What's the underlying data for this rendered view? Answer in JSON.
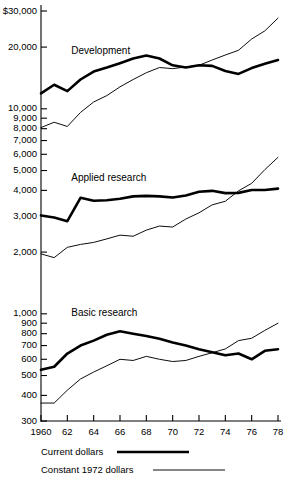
{
  "chart_data": {
    "type": "line",
    "title": "",
    "xlabel": "",
    "ylabel": "",
    "scale": "log",
    "grid": false,
    "legend_position": "bottom-left",
    "x": [
      1960,
      1961,
      1962,
      1963,
      1964,
      1965,
      1966,
      1967,
      1968,
      1969,
      1970,
      1971,
      1972,
      1973,
      1974,
      1975,
      1976,
      1977,
      1978
    ],
    "xtick_labels": [
      "1960",
      "62",
      "64",
      "66",
      "68",
      "70",
      "72",
      "74",
      "76",
      "78"
    ],
    "xtick_values": [
      1960,
      1962,
      1964,
      1966,
      1968,
      1970,
      1972,
      1974,
      1976,
      1978
    ],
    "ytick_labels": [
      "$30,000",
      "20,000",
      "10,000",
      "9,000",
      "8,000",
      "7,000",
      "6,000",
      "5,000",
      "4,000",
      "3,000",
      "2,000",
      "1,000",
      "900",
      "800",
      "700",
      "600",
      "500",
      "400",
      "300"
    ],
    "ytick_values": [
      30000,
      20000,
      10000,
      9000,
      8000,
      7000,
      6000,
      5000,
      4000,
      3000,
      2000,
      1000,
      900,
      800,
      700,
      600,
      500,
      400,
      300
    ],
    "ylim": [
      290,
      34000
    ],
    "panels": [
      {
        "label": "Development",
        "label_value": 19000,
        "label_year": 1962.3
      },
      {
        "label": "Applied research",
        "label_value": 4600,
        "label_year": 1962.3
      },
      {
        "label": "Basic research",
        "label_value": 1000,
        "label_year": 1962.3
      }
    ],
    "series": [
      {
        "name": "Current dollars",
        "panel": "Development",
        "style": "thick",
        "values": [
          11900,
          13100,
          12200,
          13900,
          15200,
          15900,
          16700,
          17600,
          18200,
          17600,
          16300,
          15900,
          16300,
          16200,
          15300,
          14800,
          15800,
          16600,
          17300
        ]
      },
      {
        "name": "Constant 1972 dollars",
        "panel": "Development",
        "style": "thin",
        "values": [
          8100,
          8600,
          8200,
          9600,
          10800,
          11600,
          12800,
          13900,
          15000,
          15900,
          15700,
          16000,
          16300,
          17300,
          18300,
          19300,
          21900,
          24000,
          27700
        ]
      },
      {
        "name": "Current dollars",
        "panel": "Applied research",
        "style": "thick",
        "values": [
          3020,
          2950,
          2830,
          3680,
          3560,
          3580,
          3640,
          3740,
          3760,
          3740,
          3690,
          3780,
          3940,
          3980,
          3880,
          3890,
          4020,
          4020,
          4080
        ]
      },
      {
        "name": "Constant 1972 dollars",
        "panel": "Applied research",
        "style": "thin",
        "values": [
          1960,
          1880,
          2110,
          2180,
          2230,
          2320,
          2420,
          2390,
          2560,
          2680,
          2650,
          2900,
          3110,
          3400,
          3540,
          3980,
          4330,
          5050,
          5800
        ]
      },
      {
        "name": "Current dollars",
        "panel": "Basic research",
        "style": "thick",
        "values": [
          533,
          552,
          640,
          700,
          740,
          790,
          822,
          800,
          780,
          755,
          724,
          700,
          672,
          650,
          628,
          640,
          600,
          660,
          672
        ]
      },
      {
        "name": "Constant 1972 dollars",
        "panel": "Basic research",
        "style": "thin",
        "values": [
          367,
          367,
          424,
          481,
          520,
          558,
          600,
          592,
          620,
          600,
          585,
          592,
          620,
          646,
          674,
          740,
          760,
          830,
          900
        ]
      }
    ],
    "legend": [
      {
        "label": "Current dollars",
        "style": "thick"
      },
      {
        "label": "Constant 1972 dollars",
        "style": "thin"
      }
    ]
  }
}
